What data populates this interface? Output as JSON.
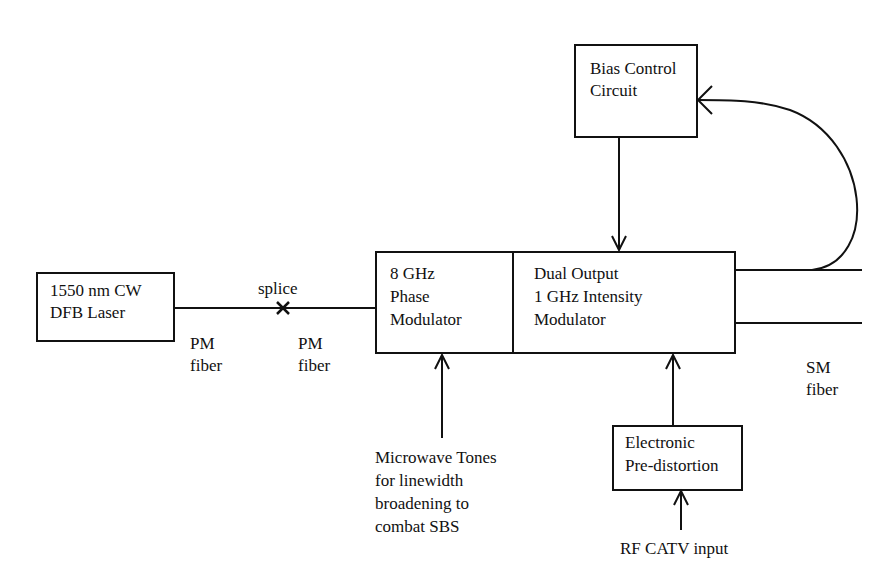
{
  "diagram": {
    "blocks": {
      "laser": {
        "line1": "1550 nm CW",
        "line2": "DFB Laser"
      },
      "phase_modulator": {
        "line1": "8 GHz",
        "line2": "Phase",
        "line3": "Modulator"
      },
      "intensity_modulator": {
        "line1": "Dual Output",
        "line2": "1 GHz Intensity",
        "line3": "Modulator"
      },
      "bias_control": {
        "line1": "Bias Control",
        "line2": "Circuit"
      },
      "predistortion": {
        "line1": "Electronic",
        "line2": "Pre-distortion"
      }
    },
    "labels": {
      "splice": "splice",
      "pm_fiber_1": {
        "line1": "PM",
        "line2": "fiber"
      },
      "pm_fiber_2": {
        "line1": "PM",
        "line2": "fiber"
      },
      "sm_fiber": {
        "line1": "SM",
        "line2": "fiber"
      },
      "microwave": {
        "line1": "Microwave Tones",
        "line2": "for linewidth",
        "line3": "broadening to",
        "line4": "combat SBS"
      },
      "rf_input": "RF CATV input"
    },
    "splice_marker": "×",
    "colors": {
      "line": "#111111",
      "background": "#ffffff"
    }
  }
}
